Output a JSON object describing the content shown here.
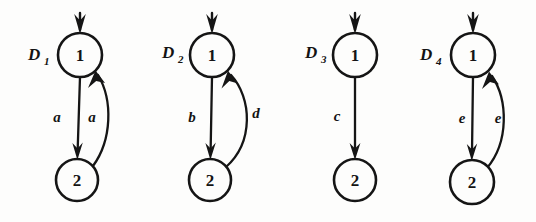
{
  "figure": {
    "caption": "",
    "background_color": "#fdfdfc",
    "ink_color": "#151515",
    "node_labels": {
      "start": "1",
      "end": "2"
    },
    "diagrams": [
      {
        "name": "D",
        "subscript": "1",
        "name_full": "D1",
        "nodes": [
          {
            "id": "n1",
            "label": "1",
            "cx": 80,
            "cy": 55,
            "r": 22
          },
          {
            "id": "n2",
            "label": "2",
            "cx": 77,
            "cy": 180,
            "r": 21
          }
        ],
        "initial_arrow": {
          "from_y": 12,
          "to_y": 31,
          "x": 80
        },
        "edges": [
          {
            "id": "e-down",
            "from": "n1",
            "to": "n2",
            "label": "a",
            "shape": "straight",
            "label_x": 57,
            "label_y": 122
          },
          {
            "id": "e-up",
            "from": "n2",
            "to": "n1",
            "label": "a",
            "shape": "curved-right",
            "label_x": 92,
            "label_y": 122
          }
        ]
      },
      {
        "name": "D",
        "subscript": "2",
        "name_full": "D2",
        "nodes": [
          {
            "id": "n1",
            "label": "1",
            "cx": 212,
            "cy": 55,
            "r": 22
          },
          {
            "id": "n2",
            "label": "2",
            "cx": 210,
            "cy": 180,
            "r": 21
          }
        ],
        "initial_arrow": {
          "from_y": 12,
          "to_y": 31,
          "x": 212
        },
        "edges": [
          {
            "id": "e-down",
            "from": "n1",
            "to": "n2",
            "label": "b",
            "shape": "straight",
            "label_x": 192,
            "label_y": 122
          },
          {
            "id": "e-up",
            "from": "n2",
            "to": "n1",
            "label": "d",
            "shape": "curved-right",
            "label_x": 256,
            "label_y": 118
          }
        ]
      },
      {
        "name": "D",
        "subscript": "3",
        "name_full": "D3",
        "nodes": [
          {
            "id": "n1",
            "label": "1",
            "cx": 355,
            "cy": 55,
            "r": 22
          },
          {
            "id": "n2",
            "label": "2",
            "cx": 355,
            "cy": 180,
            "r": 21
          }
        ],
        "initial_arrow": {
          "from_y": 12,
          "to_y": 31,
          "x": 355
        },
        "edges": [
          {
            "id": "e-down",
            "from": "n1",
            "to": "n2",
            "label": "c",
            "shape": "straight",
            "label_x": 337,
            "label_y": 121
          }
        ]
      },
      {
        "name": "D",
        "subscript": "4",
        "name_full": "D4",
        "nodes": [
          {
            "id": "n1",
            "label": "1",
            "cx": 473,
            "cy": 55,
            "r": 22
          },
          {
            "id": "n2",
            "label": "2",
            "cx": 472,
            "cy": 182,
            "r": 22
          }
        ],
        "initial_arrow": {
          "from_y": 12,
          "to_y": 31,
          "x": 473
        },
        "edges": [
          {
            "id": "e-down",
            "from": "n1",
            "to": "n2",
            "label": "e",
            "shape": "straight",
            "label_x": 462,
            "label_y": 123
          },
          {
            "id": "e-up",
            "from": "n2",
            "to": "n1",
            "label": "e",
            "shape": "curved-right",
            "label_x": 498,
            "label_y": 123
          }
        ]
      }
    ],
    "diagram_name_positions": [
      {
        "x": 28,
        "y": 60,
        "sub_dx": 15,
        "sub_dy": 5
      },
      {
        "x": 162,
        "y": 58,
        "sub_dx": 15,
        "sub_dy": 5
      },
      {
        "x": 305,
        "y": 58,
        "sub_dx": 15,
        "sub_dy": 5
      },
      {
        "x": 420,
        "y": 60,
        "sub_dx": 15,
        "sub_dy": 5
      }
    ]
  }
}
